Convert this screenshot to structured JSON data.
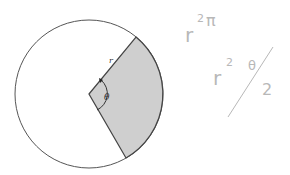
{
  "diagram": {
    "type": "circle-sector",
    "circle": {
      "cx": 89,
      "cy": 94,
      "r": 74,
      "stroke": "#555555",
      "fill": "#ffffff"
    },
    "sector": {
      "fill": "#cfcfcf",
      "stroke": "#444444",
      "start_point": [
        136,
        37
      ],
      "end_point": [
        126,
        158
      ]
    },
    "labels": {
      "radius": "r",
      "angle": "θ"
    }
  },
  "handwriting": {
    "line1": {
      "base": "r",
      "exp": "2",
      "tail": "π"
    },
    "line2": {
      "base": "r",
      "exp": "2",
      "numer": "θ",
      "denom": "2"
    },
    "color": "#b8b8b8"
  }
}
